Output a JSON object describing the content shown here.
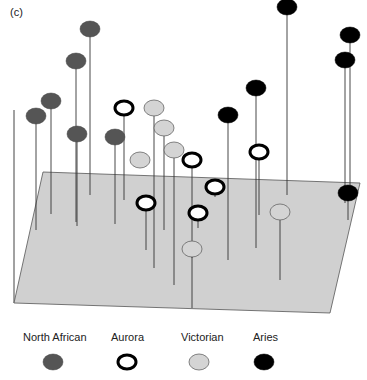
{
  "chart_data": {
    "type": "scatter",
    "subtype": "3d-pin-plot",
    "title": "",
    "panel_label": "(c)",
    "xlabel": "",
    "ylabel": "",
    "zlabel": "",
    "grid": false,
    "legend_position": "bottom",
    "plane": {
      "fill": "#d0d0d0",
      "corners": [
        [
          43,
          172
        ],
        [
          360,
          183
        ],
        [
          330,
          313
        ],
        [
          14,
          303
        ]
      ]
    },
    "vertical_axis": {
      "x": 14,
      "y_top": 110,
      "y_bottom": 303
    },
    "series": [
      {
        "name": "North African",
        "style": "filled",
        "fill": "#555555",
        "stroke": "#444444",
        "points": [
          {
            "x": 90,
            "y": 29,
            "base_y": 195
          },
          {
            "x": 76,
            "y": 61,
            "base_y": 222
          },
          {
            "x": 51,
            "y": 101,
            "base_y": 214
          },
          {
            "x": 36,
            "y": 116,
            "base_y": 230
          },
          {
            "x": 77,
            "y": 134,
            "base_y": 226
          },
          {
            "x": 115,
            "y": 137,
            "base_y": 224
          }
        ]
      },
      {
        "name": "Aurora",
        "style": "ring",
        "fill": "#ffffff",
        "stroke": "#000000",
        "points": [
          {
            "x": 124,
            "y": 108,
            "base_y": 200
          },
          {
            "x": 192,
            "y": 160,
            "base_y": 258
          },
          {
            "x": 259,
            "y": 152,
            "base_y": 215
          },
          {
            "x": 215,
            "y": 187,
            "base_y": 197
          },
          {
            "x": 146,
            "y": 203,
            "base_y": 250
          },
          {
            "x": 198,
            "y": 213,
            "base_y": 228
          }
        ]
      },
      {
        "name": "Victorian",
        "style": "light",
        "fill": "#d4d4d4",
        "stroke": "#666666",
        "points": [
          {
            "x": 154,
            "y": 108,
            "base_y": 268
          },
          {
            "x": 164,
            "y": 128,
            "base_y": 230
          },
          {
            "x": 174,
            "y": 150,
            "base_y": 285
          },
          {
            "x": 140,
            "y": 160,
            "base_y": 168
          },
          {
            "x": 280,
            "y": 212,
            "base_y": 280
          },
          {
            "x": 192,
            "y": 249,
            "base_y": 308
          }
        ]
      },
      {
        "name": "Aries",
        "style": "filled",
        "fill": "#000000",
        "stroke": "#000000",
        "points": [
          {
            "x": 287,
            "y": 7,
            "base_y": 195
          },
          {
            "x": 350,
            "y": 35,
            "base_y": 190
          },
          {
            "x": 345,
            "y": 60,
            "base_y": 203
          },
          {
            "x": 256,
            "y": 88,
            "base_y": 248
          },
          {
            "x": 228,
            "y": 115,
            "base_y": 260
          },
          {
            "x": 348,
            "y": 193,
            "base_y": 220
          }
        ]
      }
    ],
    "legend": [
      {
        "label": "North African",
        "label_x": 23,
        "marker_x": 53
      },
      {
        "label": "Aurora",
        "label_x": 111,
        "marker_x": 127
      },
      {
        "label": "Victorian",
        "label_x": 181,
        "marker_x": 199
      },
      {
        "label": "Aries",
        "label_x": 253,
        "marker_x": 264
      }
    ]
  }
}
